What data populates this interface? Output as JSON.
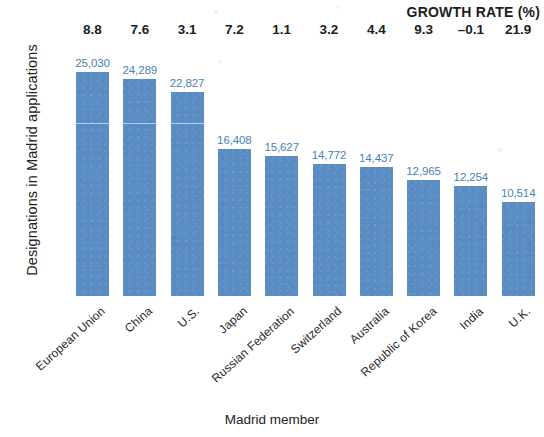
{
  "chart_data": {
    "type": "bar",
    "title": "",
    "xlabel": "Madrid member",
    "ylabel": "Designations in Madrid applications",
    "grid": false,
    "legend": null,
    "ylim": [
      0,
      27000
    ],
    "categories": [
      "European Union",
      "China",
      "U.S.",
      "Japan",
      "Russian Federation",
      "Switzerland",
      "Australia",
      "Republic of Korea",
      "India",
      "U.K."
    ],
    "values": [
      25030,
      24289,
      22827,
      16408,
      15627,
      14772,
      14437,
      12965,
      12254,
      10514
    ],
    "value_labels": [
      "25,030",
      "24,289",
      "22,827",
      "16,408",
      "15,627",
      "14,772",
      "14,437",
      "12,965",
      "12,254",
      "10,514"
    ],
    "annotations": {
      "growth_rate_header": "GROWTH RATE (%)",
      "growth_rate_labels": [
        "8.8",
        "7.6",
        "3.1",
        "7.2",
        "1.1",
        "3.2",
        "4.4",
        "9.3",
        "–0.1",
        "21.9"
      ],
      "growth_rate_values": [
        8.8,
        7.6,
        3.1,
        7.2,
        1.1,
        3.2,
        4.4,
        9.3,
        -0.1,
        21.9
      ]
    },
    "colors": {
      "bar": "#5a8cc4",
      "value_label": "#4a7fb5",
      "axis_text": "#222222"
    }
  }
}
